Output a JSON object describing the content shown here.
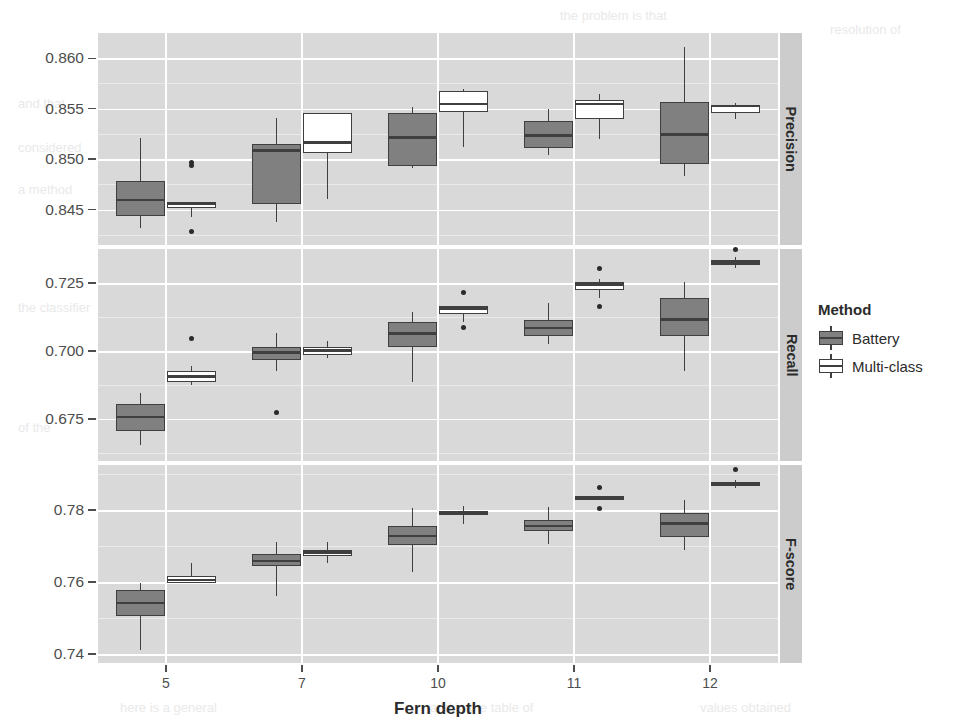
{
  "chart_data": {
    "type": "box",
    "title": "",
    "xlabel": "Fern depth",
    "ylabel": "",
    "categories": [
      "5",
      "7",
      "10",
      "11",
      "12"
    ],
    "legend": {
      "title": "Method",
      "position": "right",
      "entries": [
        {
          "name": "Battery",
          "color": "#808080",
          "key": "battery"
        },
        {
          "name": "Multi-class",
          "color": "#ffffff",
          "key": "multiclass"
        }
      ]
    },
    "grid": true,
    "panels": [
      {
        "name": "Precision",
        "ylim": [
          0.8415,
          0.8625
        ],
        "yticks": [
          0.845,
          0.85,
          0.855,
          0.86
        ],
        "ytick_labels": [
          "0.845",
          "0.850",
          "0.855",
          "0.860"
        ],
        "boxes": [
          {
            "category": "5",
            "method": "Battery",
            "whisker_lo": 0.8432,
            "q1": 0.8444,
            "median": 0.84595,
            "q3": 0.84785,
            "whisker_hi": 0.85205,
            "outliers": []
          },
          {
            "category": "5",
            "method": "Multi-class",
            "whisker_lo": 0.8443,
            "q1": 0.84515,
            "median": 0.84555,
            "q3": 0.84575,
            "whisker_hi": 0.84575,
            "outliers": [
              0.84965,
              0.84935,
              0.84285
            ]
          },
          {
            "category": "7",
            "method": "Battery",
            "whisker_lo": 0.84375,
            "q1": 0.84555,
            "median": 0.85085,
            "q3": 0.85155,
            "whisker_hi": 0.85405,
            "outliers": []
          },
          {
            "category": "7",
            "method": "Multi-class",
            "whisker_lo": 0.84605,
            "q1": 0.85065,
            "median": 0.85165,
            "q3": 0.85455,
            "whisker_hi": 0.85455,
            "outliers": []
          },
          {
            "category": "10",
            "method": "Battery",
            "whisker_lo": 0.84915,
            "q1": 0.84935,
            "median": 0.85215,
            "q3": 0.85455,
            "whisker_hi": 0.85515,
            "outliers": []
          },
          {
            "category": "10",
            "method": "Multi-class",
            "whisker_lo": 0.85125,
            "q1": 0.85465,
            "median": 0.85545,
            "q3": 0.85675,
            "whisker_hi": 0.85695,
            "outliers": []
          },
          {
            "category": "11",
            "method": "Battery",
            "whisker_lo": 0.85045,
            "q1": 0.85115,
            "median": 0.85235,
            "q3": 0.85375,
            "whisker_hi": 0.85495,
            "outliers": []
          },
          {
            "category": "11",
            "method": "Multi-class",
            "whisker_lo": 0.85195,
            "q1": 0.85395,
            "median": 0.85545,
            "q3": 0.85585,
            "whisker_hi": 0.85645,
            "outliers": []
          },
          {
            "category": "12",
            "method": "Battery",
            "whisker_lo": 0.84835,
            "q1": 0.84955,
            "median": 0.85245,
            "q3": 0.85565,
            "whisker_hi": 0.86115,
            "outliers": []
          },
          {
            "category": "12",
            "method": "Multi-class",
            "whisker_lo": 0.85395,
            "q1": 0.85455,
            "median": 0.85525,
            "q3": 0.85535,
            "whisker_hi": 0.85555,
            "outliers": []
          }
        ]
      },
      {
        "name": "Recall",
        "ylim": [
          0.6595,
          0.7375
        ],
        "yticks": [
          0.675,
          0.7,
          0.725
        ],
        "ytick_labels": [
          "0.675",
          "0.700",
          "0.725"
        ],
        "boxes": [
          {
            "category": "5",
            "method": "Battery",
            "whisker_lo": 0.6655,
            "q1": 0.6705,
            "median": 0.6757,
            "q3": 0.6805,
            "whisker_hi": 0.6845,
            "outliers": []
          },
          {
            "category": "5",
            "method": "Multi-class",
            "whisker_lo": 0.6875,
            "q1": 0.6885,
            "median": 0.6905,
            "q3": 0.6925,
            "whisker_hi": 0.6945,
            "outliers": [
              0.7045
            ]
          },
          {
            "category": "7",
            "method": "Battery",
            "whisker_lo": 0.6925,
            "q1": 0.6965,
            "median": 0.6995,
            "q3": 0.7015,
            "whisker_hi": 0.7065,
            "outliers": [
              0.6775
            ]
          },
          {
            "category": "7",
            "method": "Multi-class",
            "whisker_lo": 0.6975,
            "q1": 0.6985,
            "median": 0.7002,
            "q3": 0.7015,
            "whisker_hi": 0.7035,
            "outliers": []
          },
          {
            "category": "10",
            "method": "Battery",
            "whisker_lo": 0.6885,
            "q1": 0.7015,
            "median": 0.7065,
            "q3": 0.7105,
            "whisker_hi": 0.7145,
            "outliers": []
          },
          {
            "category": "10",
            "method": "Multi-class",
            "whisker_lo": 0.7105,
            "q1": 0.7135,
            "median": 0.7155,
            "q3": 0.7165,
            "whisker_hi": 0.7165,
            "outliers": [
              0.7215,
              0.7085
            ]
          },
          {
            "category": "11",
            "method": "Battery",
            "whisker_lo": 0.7025,
            "q1": 0.7055,
            "median": 0.7085,
            "q3": 0.7115,
            "whisker_hi": 0.7175,
            "outliers": []
          },
          {
            "category": "11",
            "method": "Multi-class",
            "whisker_lo": 0.7195,
            "q1": 0.7225,
            "median": 0.7245,
            "q3": 0.7255,
            "whisker_hi": 0.7265,
            "outliers": [
              0.7305,
              0.7165
            ]
          },
          {
            "category": "12",
            "method": "Battery",
            "whisker_lo": 0.6925,
            "q1": 0.7055,
            "median": 0.7115,
            "q3": 0.7195,
            "whisker_hi": 0.7255,
            "outliers": []
          },
          {
            "category": "12",
            "method": "Multi-class",
            "whisker_lo": 0.7305,
            "q1": 0.7315,
            "median": 0.7325,
            "q3": 0.7335,
            "whisker_hi": 0.7345,
            "outliers": [
              0.7375
            ]
          }
        ]
      },
      {
        "name": "F-score",
        "ylim": [
          0.7375,
          0.7925
        ],
        "yticks": [
          0.74,
          0.76,
          0.78
        ],
        "ytick_labels": [
          "0.74",
          "0.76",
          "0.78"
        ],
        "boxes": [
          {
            "category": "5",
            "method": "Battery",
            "whisker_lo": 0.7412,
            "q1": 0.7505,
            "median": 0.7542,
            "q3": 0.7578,
            "whisker_hi": 0.7598,
            "outliers": []
          },
          {
            "category": "5",
            "method": "Multi-class",
            "whisker_lo": 0.7598,
            "q1": 0.7598,
            "median": 0.7605,
            "q3": 0.7618,
            "whisker_hi": 0.7652,
            "outliers": []
          },
          {
            "category": "7",
            "method": "Battery",
            "whisker_lo": 0.7562,
            "q1": 0.7645,
            "median": 0.7658,
            "q3": 0.7678,
            "whisker_hi": 0.7712,
            "outliers": []
          },
          {
            "category": "7",
            "method": "Multi-class",
            "whisker_lo": 0.7652,
            "q1": 0.7672,
            "median": 0.7682,
            "q3": 0.7688,
            "whisker_hi": 0.7712,
            "outliers": []
          },
          {
            "category": "10",
            "method": "Battery",
            "whisker_lo": 0.7628,
            "q1": 0.7702,
            "median": 0.7728,
            "q3": 0.7755,
            "whisker_hi": 0.7805,
            "outliers": []
          },
          {
            "category": "10",
            "method": "Multi-class",
            "whisker_lo": 0.7762,
            "q1": 0.7785,
            "median": 0.7792,
            "q3": 0.7798,
            "whisker_hi": 0.7812,
            "outliers": []
          },
          {
            "category": "11",
            "method": "Battery",
            "whisker_lo": 0.7705,
            "q1": 0.7742,
            "median": 0.7755,
            "q3": 0.7772,
            "whisker_hi": 0.7808,
            "outliers": []
          },
          {
            "category": "11",
            "method": "Multi-class",
            "whisker_lo": 0.7828,
            "q1": 0.7828,
            "median": 0.7832,
            "q3": 0.7838,
            "whisker_hi": 0.7838,
            "outliers": [
              0.7862,
              0.7805
            ]
          },
          {
            "category": "12",
            "method": "Battery",
            "whisker_lo": 0.7688,
            "q1": 0.7725,
            "median": 0.7762,
            "q3": 0.7792,
            "whisker_hi": 0.7828,
            "outliers": []
          },
          {
            "category": "12",
            "method": "Multi-class",
            "whisker_lo": 0.7862,
            "q1": 0.7868,
            "median": 0.7872,
            "q3": 0.7878,
            "whisker_hi": 0.7882,
            "outliers": [
              0.7912
            ]
          }
        ]
      }
    ]
  },
  "ghost_text": [
    {
      "text": "the problem is that",
      "x": 560,
      "y": 8
    },
    {
      "text": "resolution of",
      "x": 830,
      "y": 22
    },
    {
      "text": "and that",
      "x": 18,
      "y": 96
    },
    {
      "text": "considered",
      "x": 18,
      "y": 140
    },
    {
      "text": "a method",
      "x": 18,
      "y": 182
    },
    {
      "text": "the classifier",
      "x": 18,
      "y": 300
    },
    {
      "text": "of the",
      "x": 18,
      "y": 420
    },
    {
      "text": "here is a general",
      "x": 120,
      "y": 700
    },
    {
      "text": "and in the table of",
      "x": 430,
      "y": 700
    },
    {
      "text": "values obtained",
      "x": 700,
      "y": 700
    }
  ]
}
